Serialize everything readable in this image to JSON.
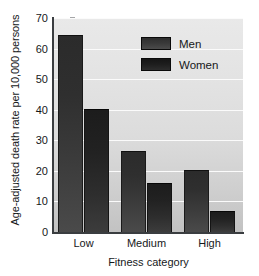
{
  "chart_data": {
    "type": "bar",
    "title": "",
    "xlabel": "Fitness category",
    "ylabel": "Age-adjusted death rate per 10,000 persons",
    "categories": [
      "Low",
      "Medium",
      "High"
    ],
    "series": [
      {
        "name": "Men",
        "values": [
          64.5,
          26.5,
          20.3
        ],
        "color": "#3a3a3a"
      },
      {
        "name": "Women",
        "values": [
          40.2,
          16.1,
          6.9
        ],
        "color": "#1e1e1e"
      }
    ],
    "ylim": [
      0,
      70
    ],
    "yticks": [
      0,
      10,
      20,
      30,
      40,
      50,
      60,
      70
    ],
    "ytick_labels": [
      "0",
      "10",
      "20",
      "30",
      "40",
      "50",
      "60",
      "70"
    ],
    "grid": true,
    "grid_axis": "y",
    "legend_position": "top-right",
    "plot_background": "#dedede"
  },
  "legend": {
    "items": [
      {
        "label": "Men"
      },
      {
        "label": "Women"
      }
    ]
  },
  "axes": {
    "y_title": "Age-adjusted death rate per 10,000 persons",
    "x_title": "Fitness category"
  }
}
